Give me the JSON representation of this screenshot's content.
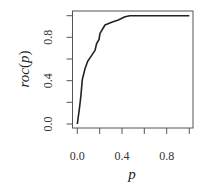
{
  "chart_data": {
    "type": "line",
    "title": "",
    "xlabel": "p",
    "ylabel": "roc(p)",
    "xlim": [
      0,
      1
    ],
    "ylim": [
      0,
      1
    ],
    "grid": false,
    "legend": null,
    "x_ticks": [
      0.0,
      0.2,
      0.4,
      0.6,
      0.8,
      1.0
    ],
    "x_tick_labels": [
      "0.0",
      "0.4",
      "0.8"
    ],
    "x_tick_label_values": [
      0.0,
      0.4,
      0.8
    ],
    "y_ticks": [
      0.0,
      0.2,
      0.4,
      0.6,
      0.8,
      1.0
    ],
    "y_tick_labels": [
      "0.0",
      "0.4",
      "0.8"
    ],
    "y_tick_label_values": [
      0.0,
      0.4,
      0.8
    ],
    "series": [
      {
        "name": "roc",
        "color": "#222222",
        "x": [
          0.0,
          0.02,
          0.033,
          0.045,
          0.069,
          0.093,
          0.113,
          0.158,
          0.173,
          0.194,
          0.203,
          0.247,
          0.307,
          0.366,
          0.426,
          0.47,
          0.6,
          0.8,
          1.0
        ],
        "y": [
          0.0,
          0.15,
          0.27,
          0.41,
          0.51,
          0.58,
          0.61,
          0.68,
          0.745,
          0.78,
          0.837,
          0.914,
          0.939,
          0.96,
          0.99,
          1.0,
          1.0,
          1.0,
          1.0
        ]
      }
    ]
  },
  "labels": {
    "xlabel": "p",
    "ylabel_prefix": "roc",
    "ylabel_arg": "p",
    "x_ticks": [
      "0.0",
      "0.4",
      "0.8"
    ],
    "y_ticks": [
      "0.0",
      "0.4",
      "0.8"
    ]
  },
  "colors": {
    "axis": "#555555",
    "curve": "#222222",
    "text": "#333333"
  }
}
